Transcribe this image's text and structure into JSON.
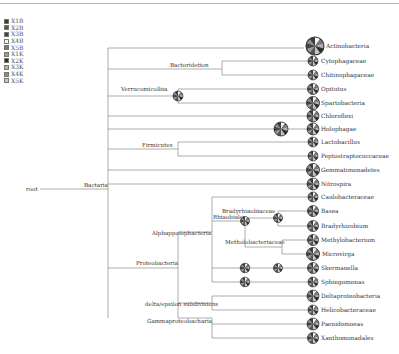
{
  "legend": {
    "items": [
      {
        "label": "X1B",
        "color": "#3a3a3a"
      },
      {
        "label": "X2B",
        "color": "#555555"
      },
      {
        "label": "X3B",
        "color": "#444444"
      },
      {
        "label": "X4B",
        "color": "#f4f4f4"
      },
      {
        "label": "X5B",
        "color": "#7a7a7a"
      },
      {
        "label": "X1K",
        "color": "#9a9a9a"
      },
      {
        "label": "X2K",
        "color": "#2e2e2e"
      },
      {
        "label": "X3K",
        "color": "#b0b0b0"
      },
      {
        "label": "X4K",
        "color": "#8c8c8c"
      },
      {
        "label": "X5K",
        "color": "#c4c4c4"
      }
    ]
  },
  "tree": {
    "root": "root",
    "internal_nodes": [
      {
        "id": "bactaria",
        "label": "Bactaria"
      },
      {
        "id": "bacteroidetes",
        "label": "Bactoridetion"
      },
      {
        "id": "verrucomicrobia",
        "label": "Verrucomicolbia"
      },
      {
        "id": "firmicutes",
        "label": "Firmicutes"
      },
      {
        "id": "proteobacteria",
        "label": "Proteobacteria"
      },
      {
        "id": "alphaproteo",
        "label": "Alphappoiophacteria"
      },
      {
        "id": "rhizobiales",
        "label": "Rhiaobiales"
      },
      {
        "id": "bradyrhizobiaceae",
        "label": "Bradyrhiaobiaceae"
      },
      {
        "id": "methylobacteriaceae",
        "label": "Metholobacteriaceae"
      },
      {
        "id": "deltaepsilon",
        "label": "delta/epsilon subdivisions"
      },
      {
        "id": "gammaproteo",
        "label": "Gammaproteobacharia"
      }
    ],
    "leaves": [
      {
        "label": "Actinobacteria"
      },
      {
        "label": "Cytophagaceae"
      },
      {
        "label": "Chitinophagaceae"
      },
      {
        "label": "Opitutus"
      },
      {
        "label": "Spartobacteria"
      },
      {
        "label": "Chloroflexi"
      },
      {
        "label": "Holophagae"
      },
      {
        "label": "Lactobacillus"
      },
      {
        "label": "Peptostraptococcaceae"
      },
      {
        "label": "Gemmatimonadetes"
      },
      {
        "label": "Nitrospira"
      },
      {
        "label": "Caulobacteraceae"
      },
      {
        "label": "Basea"
      },
      {
        "label": "Bradyrhizobium"
      },
      {
        "label": "Methylobacterium"
      },
      {
        "label": "Microvirga"
      },
      {
        "label": "Skermanella"
      },
      {
        "label": "Sphingomonas"
      },
      {
        "label": "Deltaproteobacteria"
      },
      {
        "label": "Helicobacteraceae"
      },
      {
        "label": "Paenidomoeas"
      },
      {
        "label": "Xanthomonadales"
      }
    ]
  }
}
